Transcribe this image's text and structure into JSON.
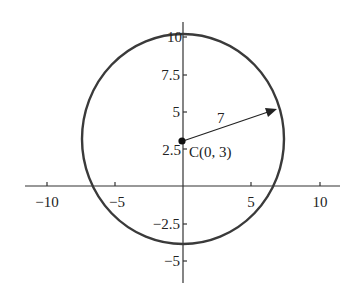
{
  "diagram": {
    "title": "",
    "center_label": "C(0, 3)",
    "radius_label": "7",
    "x_ticks": [
      {
        "value": -10,
        "label": "−10",
        "px": 47
      },
      {
        "value": -5,
        "label": "−5",
        "px": 115
      },
      {
        "value": 5,
        "label": "5",
        "px": 251
      },
      {
        "value": 10,
        "label": "10",
        "px": 320
      }
    ],
    "y_ticks": [
      {
        "value": 10,
        "label": "10",
        "py": 37
      },
      {
        "value": 7.5,
        "label": "7.5",
        "py": 75
      },
      {
        "value": 5,
        "label": "5",
        "py": 112
      },
      {
        "value": 2.5,
        "label": "2.5",
        "py": 149
      },
      {
        "value": -2.5,
        "label": "−2.5",
        "py": 224
      },
      {
        "value": -5,
        "label": "−5",
        "py": 261
      }
    ],
    "circle": {
      "center": [
        0,
        3
      ],
      "radius": 7
    },
    "colors": {
      "circle": "#3a3a3a",
      "axes": "#333333"
    }
  }
}
